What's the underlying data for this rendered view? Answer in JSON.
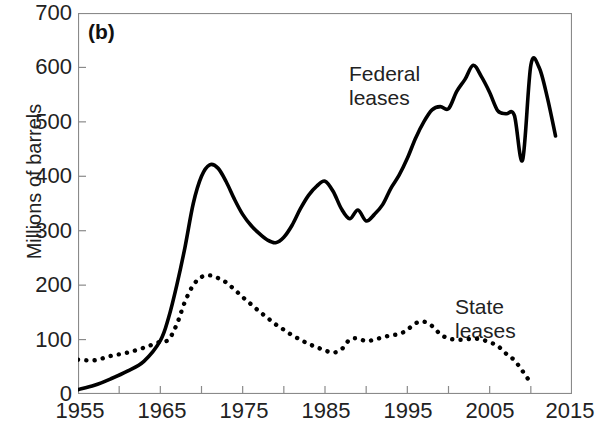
{
  "panel": {
    "label": "(b)"
  },
  "axes": {
    "ylabel": "Millions of barrels",
    "yticks": [
      0,
      100,
      200,
      300,
      400,
      500,
      600,
      700
    ],
    "xticks": [
      1955,
      1965,
      1975,
      1985,
      1995,
      2005,
      2015
    ],
    "xlim": [
      1955,
      2015
    ],
    "ylim": [
      0,
      700
    ],
    "xminor_step": 5,
    "grid": false,
    "frame": "box"
  },
  "annotations": {
    "federal": {
      "line1": "Federal",
      "line2": "leases"
    },
    "state": {
      "line1": "State",
      "line2": "leases"
    }
  },
  "colors": {
    "line": "#000000",
    "frame": "#8a8a8a",
    "text": "#222222"
  },
  "chart_data": {
    "type": "line",
    "title": "",
    "xlabel": "",
    "ylabel": "Millions of barrels",
    "xlim": [
      1955,
      2015
    ],
    "ylim": [
      0,
      700
    ],
    "grid": false,
    "legend": "inline-annotations",
    "series": [
      {
        "name": "Federal leases",
        "style": "solid",
        "x": [
          1955,
          1957,
          1959,
          1961,
          1963,
          1965,
          1966,
          1967,
          1968,
          1969,
          1970,
          1971,
          1972,
          1973,
          1974,
          1975,
          1976,
          1977,
          1978,
          1979,
          1980,
          1981,
          1982,
          1983,
          1984,
          1985,
          1986,
          1987,
          1988,
          1989,
          1990,
          1991,
          1992,
          1993,
          1994,
          1995,
          1996,
          1997,
          1998,
          1999,
          2000,
          2001,
          2002,
          2003,
          2004,
          2005,
          2006,
          2007,
          2008,
          2009,
          2010,
          2011,
          2012,
          2013
        ],
        "y": [
          8,
          16,
          28,
          42,
          60,
          98,
          140,
          200,
          270,
          350,
          400,
          421,
          415,
          390,
          358,
          330,
          310,
          295,
          283,
          278,
          288,
          310,
          340,
          365,
          382,
          391,
          372,
          340,
          322,
          338,
          318,
          330,
          348,
          378,
          402,
          433,
          470,
          500,
          522,
          528,
          524,
          556,
          578,
          604,
          583,
          554,
          520,
          515,
          512,
          430,
          604,
          600,
          545,
          474
        ],
        "annotation": "Federal leases"
      },
      {
        "name": "State leases",
        "style": "dotted",
        "x": [
          1955,
          1957,
          1959,
          1961,
          1963,
          1965,
          1966,
          1967,
          1968,
          1969,
          1970,
          1971,
          1972,
          1973,
          1974,
          1975,
          1976,
          1977,
          1978,
          1979,
          1980,
          1981,
          1982,
          1983,
          1984,
          1985,
          1986,
          1987,
          1988,
          1989,
          1990,
          1991,
          1992,
          1993,
          1994,
          1995,
          1996,
          1997,
          1998,
          1999,
          2000,
          2001,
          2002,
          2003,
          2004,
          2005,
          2006,
          2007,
          2008,
          2009,
          2010
        ],
        "y": [
          63,
          62,
          70,
          76,
          85,
          96,
          100,
          128,
          170,
          200,
          215,
          218,
          213,
          205,
          192,
          178,
          165,
          152,
          140,
          128,
          118,
          108,
          100,
          92,
          86,
          80,
          76,
          82,
          100,
          102,
          97,
          100,
          104,
          108,
          110,
          118,
          130,
          133,
          125,
          110,
          102,
          100,
          100,
          102,
          100,
          95,
          88,
          74,
          62,
          42,
          20
        ],
        "annotation": "State leases"
      }
    ]
  }
}
